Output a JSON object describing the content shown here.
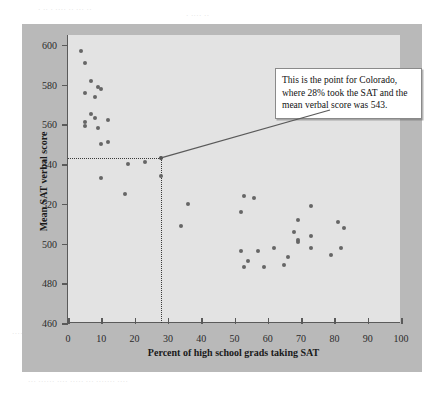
{
  "figure": {
    "callout": {
      "text": "This is the point for Colorado, where 28% took the SAT and the mean verbal score was 543."
    }
  },
  "page_artifacts": {
    "top_a": "· ·· · ···· ·· ··· ··",
    "top_b": "· ···· ··",
    "right_a": "· ····· ·· ······ ···",
    "right_b": "··· · ····· ··· ·· ····",
    "bot_a": "·· ··· ···· ··",
    "bot_b": "··· ······ ···· ····· ··· ······· ····",
    "left_a": "···· ··"
  },
  "chart_data": {
    "type": "scatter",
    "title": "",
    "xlabel": "Percent of high school grads taking SAT",
    "ylabel": "Mean SAT verbal score",
    "xlim": [
      0,
      100
    ],
    "ylim": [
      460,
      605
    ],
    "xticks": [
      0,
      10,
      20,
      30,
      40,
      50,
      60,
      70,
      80,
      90,
      100
    ],
    "yticks": [
      460,
      480,
      500,
      520,
      540,
      560,
      580,
      600
    ],
    "grid": false,
    "legend": null,
    "point_color": "#666666",
    "highlight_color": "#4a4a4a",
    "highlight_point": {
      "label": "Colorado",
      "x": 28,
      "y": 543
    },
    "reference_lines": {
      "horizontal_y": 543,
      "vertical_x": 28,
      "style": "dotted",
      "color": "#3a3a3a"
    },
    "points": [
      {
        "x": 4,
        "y": 597
      },
      {
        "x": 5,
        "y": 591
      },
      {
        "x": 7,
        "y": 582
      },
      {
        "x": 9,
        "y": 579
      },
      {
        "x": 10,
        "y": 578
      },
      {
        "x": 5,
        "y": 576
      },
      {
        "x": 8,
        "y": 574
      },
      {
        "x": 7,
        "y": 565
      },
      {
        "x": 8,
        "y": 563
      },
      {
        "x": 5,
        "y": 561
      },
      {
        "x": 12,
        "y": 562
      },
      {
        "x": 5,
        "y": 559
      },
      {
        "x": 9,
        "y": 558
      },
      {
        "x": 10,
        "y": 550
      },
      {
        "x": 12,
        "y": 551
      },
      {
        "x": 28,
        "y": 543
      },
      {
        "x": 18,
        "y": 540
      },
      {
        "x": 23,
        "y": 541
      },
      {
        "x": 10,
        "y": 533
      },
      {
        "x": 28,
        "y": 534
      },
      {
        "x": 17,
        "y": 525
      },
      {
        "x": 36,
        "y": 520
      },
      {
        "x": 34,
        "y": 509
      },
      {
        "x": 53,
        "y": 524
      },
      {
        "x": 56,
        "y": 523
      },
      {
        "x": 52,
        "y": 516
      },
      {
        "x": 73,
        "y": 519
      },
      {
        "x": 69,
        "y": 512
      },
      {
        "x": 81,
        "y": 511
      },
      {
        "x": 83,
        "y": 508
      },
      {
        "x": 68,
        "y": 506
      },
      {
        "x": 73,
        "y": 504
      },
      {
        "x": 69,
        "y": 502
      },
      {
        "x": 69,
        "y": 501
      },
      {
        "x": 62,
        "y": 498
      },
      {
        "x": 73,
        "y": 498
      },
      {
        "x": 82,
        "y": 498
      },
      {
        "x": 52,
        "y": 496
      },
      {
        "x": 57,
        "y": 496
      },
      {
        "x": 79,
        "y": 494
      },
      {
        "x": 66,
        "y": 493
      },
      {
        "x": 54,
        "y": 491
      },
      {
        "x": 65,
        "y": 489
      },
      {
        "x": 59,
        "y": 488
      },
      {
        "x": 53,
        "y": 488
      }
    ]
  }
}
